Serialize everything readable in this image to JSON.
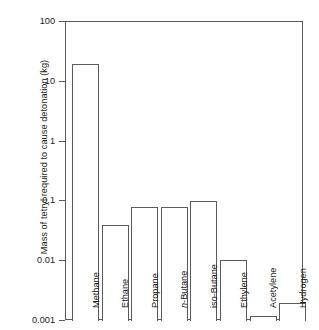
{
  "chart_data": {
    "type": "bar",
    "title": "",
    "xlabel": "",
    "ylabel": "Mass of tetryl required to cause detonation (kg)",
    "yscale": "log",
    "ylim": [
      0.001,
      100
    ],
    "yticks": [
      "100",
      "10",
      "1",
      "0.1",
      "0.01",
      "0.001"
    ],
    "ytick_values": [
      100,
      10,
      1,
      0.1,
      0.01,
      0.001
    ],
    "grid": false,
    "legend": null,
    "categories": [
      "Methane",
      "Ethane",
      "Propane",
      "n-Butane",
      "iso-Butane",
      "Ethylene",
      "Acetylene",
      "Hydrogen"
    ],
    "category_italic_prefix": {
      "n-Butane": "n"
    },
    "values": [
      20,
      0.04,
      0.08,
      0.08,
      0.1,
      0.0105,
      0.0012,
      0.002
    ],
    "bar_style": {
      "fill": "#ffffff",
      "edge": "#5a5a5a"
    }
  },
  "axis": {
    "ylabel": "Mass of tetryl required to cause detonation (kg)",
    "ticks": [
      {
        "label": "100",
        "value": 100
      },
      {
        "label": "10",
        "value": 10
      },
      {
        "label": "1",
        "value": 1
      },
      {
        "label": "0.1",
        "value": 0.1
      },
      {
        "label": "0.01",
        "value": 0.01
      },
      {
        "label": "0.001",
        "value": 0.001
      }
    ]
  },
  "bars": [
    {
      "label": "Methane",
      "value": 20
    },
    {
      "label": "Ethane",
      "value": 0.04
    },
    {
      "label": "Propane",
      "value": 0.08
    },
    {
      "label": "n-Butane",
      "value": 0.08,
      "italic_prefix": "n",
      "rest": "-Butane"
    },
    {
      "label": "iso-Butane",
      "value": 0.1
    },
    {
      "label": "Ethylene",
      "value": 0.0105
    },
    {
      "label": "Acetylene",
      "value": 0.0012
    },
    {
      "label": "Hydrogen",
      "value": 0.002
    }
  ]
}
